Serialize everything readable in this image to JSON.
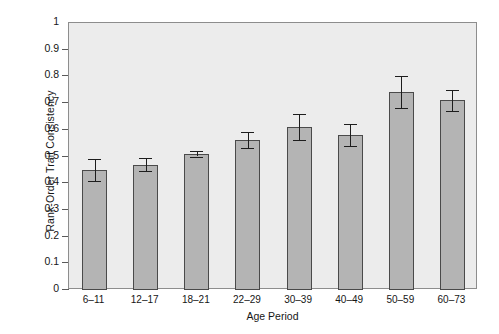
{
  "chart_data": {
    "type": "bar",
    "title": "",
    "xlabel": "Age Period",
    "ylabel": "Rank-Order Trait Consistency",
    "categories": [
      "6–11",
      "12–17",
      "18–21",
      "22–29",
      "30–39",
      "40–49",
      "50–59",
      "60–73"
    ],
    "values": [
      0.45,
      0.47,
      0.51,
      0.56,
      0.61,
      0.58,
      0.74,
      0.71
    ],
    "errors": [
      0.04,
      0.025,
      0.01,
      0.03,
      0.05,
      0.04,
      0.06,
      0.04
    ],
    "ylim": [
      0,
      1
    ],
    "yticks": [
      0,
      0.1,
      0.2,
      0.3,
      0.4,
      0.5,
      0.6,
      0.7,
      0.8,
      0.9,
      1
    ],
    "ytick_labels": [
      "0",
      "0.1",
      "0.2",
      "0.3",
      "0.4",
      "0.5",
      "0.6",
      "0.7",
      "0.8",
      "0.9",
      "1"
    ],
    "grid": false,
    "legend": null,
    "bar_color": "#b4b4b4",
    "bar_edge_color": "#4a4a4a",
    "plot_background": "#ececec",
    "error_bar_color": "#1d1d1d",
    "axis_color": "#8d8d8d"
  }
}
